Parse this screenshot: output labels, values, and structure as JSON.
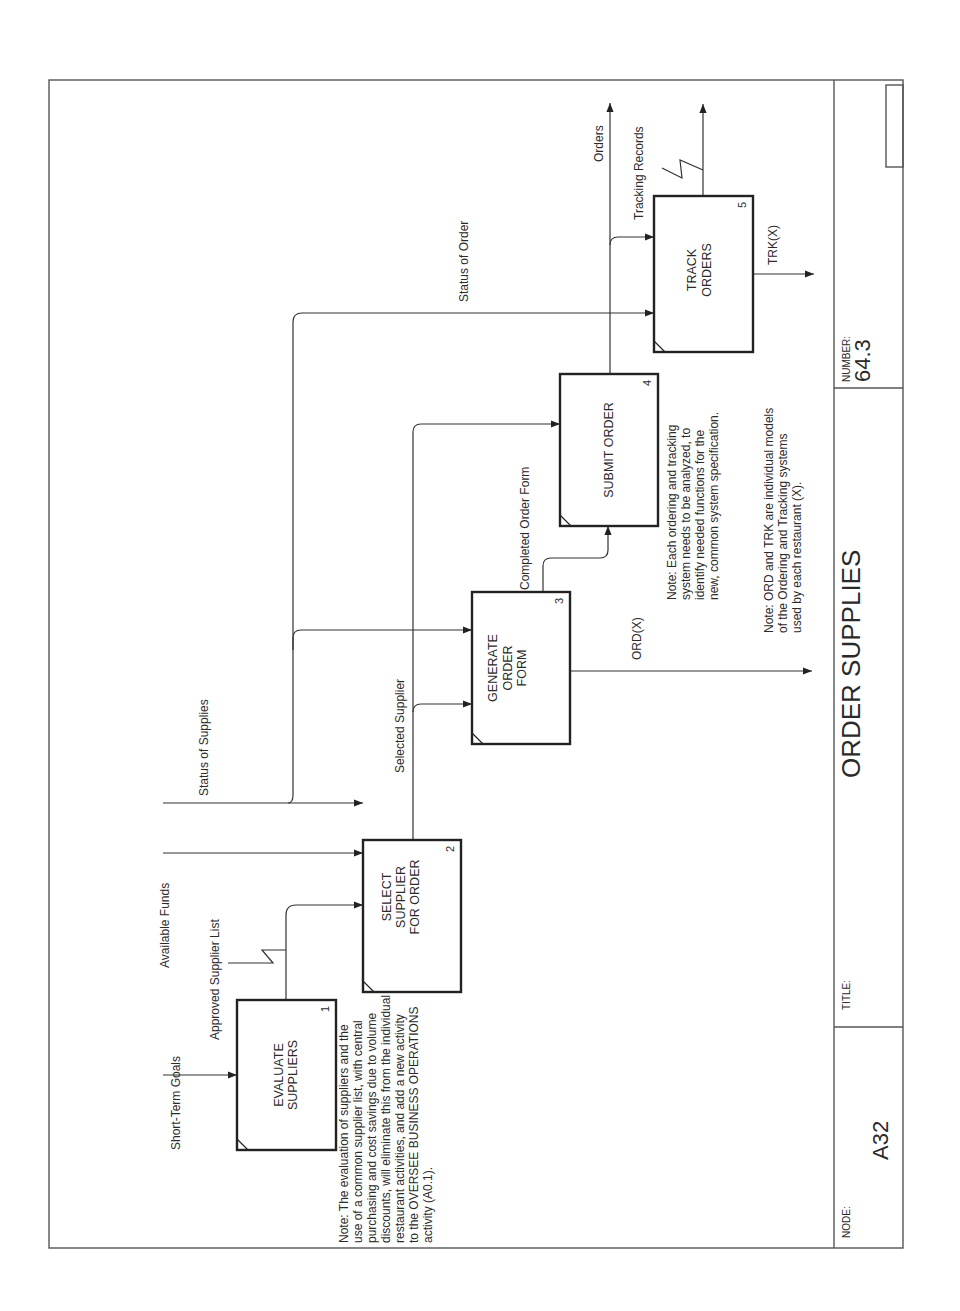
{
  "diagram": {
    "type": "IDEF0",
    "orientation": "rotated-90-ccw",
    "title_block": {
      "node_label": "NODE:",
      "node_value": "A32",
      "title_label": "TITLE:",
      "title_value": "ORDER SUPPLIES",
      "number_label": "NUMBER:",
      "number_value": "64.3"
    },
    "activities": [
      {
        "id": "1",
        "lines": [
          "EVALUATE",
          "SUPPLIERS"
        ]
      },
      {
        "id": "2",
        "lines": [
          "SELECT",
          "SUPPLIER",
          "FOR ORDER"
        ]
      },
      {
        "id": "3",
        "lines": [
          "GENERATE",
          "ORDER",
          "FORM"
        ]
      },
      {
        "id": "4",
        "lines": [
          "SUBMIT ORDER"
        ]
      },
      {
        "id": "5",
        "lines": [
          "TRACK",
          "ORDERS"
        ]
      }
    ],
    "arrows": {
      "short_term_goals": "Short-Term Goals",
      "approved_supplier_list": "Approved Supplier List",
      "available_funds": "Available Funds",
      "status_of_supplies": "Status of Supplies",
      "selected_supplier": "Selected Supplier",
      "completed_order_form": "Completed Order Form",
      "status_of_order": "Status of Order",
      "orders": "Orders",
      "tracking_records": "Tracking Records",
      "ord_x": "ORD(X)",
      "trk_x": "TRK(X)"
    },
    "notes": {
      "note1": [
        "Note:  The evaluation of suppliers and the",
        "use of a common supplier list, with central",
        "purchasing and cost savings due to volume",
        "discounts, will eliminate this from the individual",
        "restaurant activities, and add a new activity",
        "to the OVERSEE BUSINESS OPERATIONS",
        "activity (A0.1)."
      ],
      "note2": [
        "Note:  Each ordering and tracking",
        "system needs to be analyzed, to",
        "identify needed functions for the",
        "new, common system specification."
      ],
      "note3": [
        "Note:  ORD and TRK are individual models",
        "of the Ordering and Tracking systems",
        "used by each restaurant (X)."
      ]
    }
  }
}
